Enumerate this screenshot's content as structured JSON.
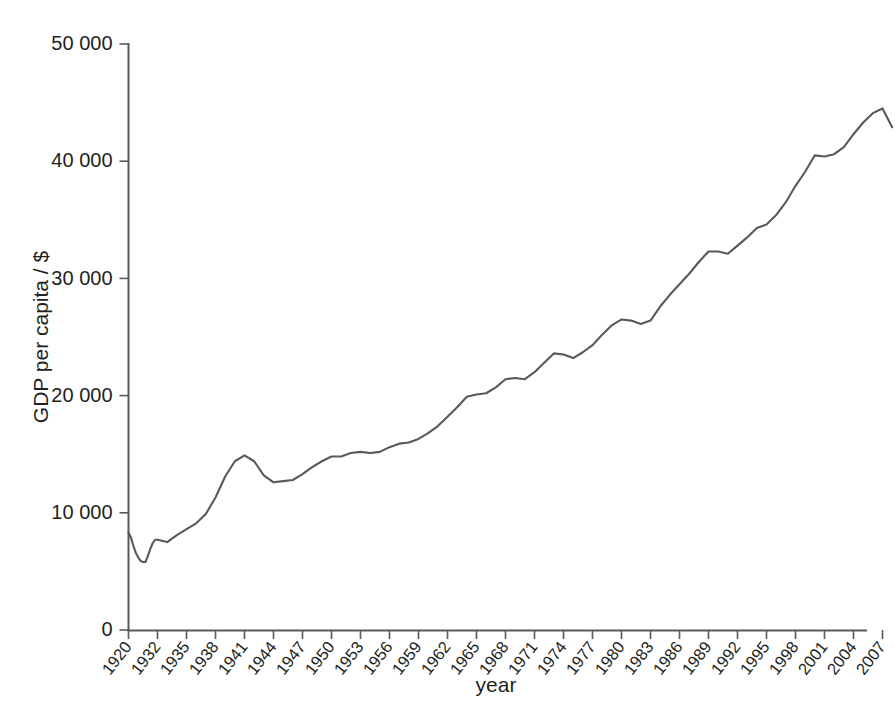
{
  "chart_data": {
    "type": "line",
    "title": "",
    "xlabel": "year",
    "ylabel": "GDP per capita / $",
    "xlim": [
      1920,
      2008
    ],
    "ylim": [
      0,
      50000
    ],
    "grid": false,
    "legend": "none",
    "line_color": "#58595b",
    "x_tick_labels": [
      "1920",
      "1932",
      "1935",
      "1938",
      "1941",
      "1944",
      "1947",
      "1950",
      "1953",
      "1956",
      "1959",
      "1962",
      "1965",
      "1968",
      "1971",
      "1974",
      "1977",
      "1980",
      "1983",
      "1986",
      "1989",
      "1992",
      "1995",
      "1998",
      "2001",
      "2004",
      "2007"
    ],
    "x_tick_values": [
      1920,
      1932,
      1935,
      1938,
      1941,
      1944,
      1947,
      1950,
      1953,
      1956,
      1959,
      1962,
      1965,
      1968,
      1971,
      1974,
      1977,
      1980,
      1983,
      1986,
      1989,
      1992,
      1995,
      1998,
      2001,
      2004,
      2007
    ],
    "y_tick_labels": [
      "0",
      "10 000",
      "20 000",
      "30 000",
      "40 000",
      "50 000"
    ],
    "y_tick_values": [
      0,
      10000,
      20000,
      30000,
      40000,
      50000
    ],
    "x": [
      1920,
      1921,
      1922,
      1923,
      1924,
      1925,
      1926,
      1927,
      1928,
      1929,
      1930,
      1931,
      1932,
      1933,
      1934,
      1935,
      1936,
      1937,
      1938,
      1939,
      1940,
      1941,
      1942,
      1943,
      1944,
      1945,
      1946,
      1947,
      1948,
      1949,
      1950,
      1951,
      1952,
      1953,
      1954,
      1955,
      1956,
      1957,
      1958,
      1959,
      1960,
      1961,
      1962,
      1963,
      1964,
      1965,
      1966,
      1967,
      1968,
      1969,
      1970,
      1971,
      1972,
      1973,
      1974,
      1975,
      1976,
      1977,
      1978,
      1979,
      1980,
      1981,
      1982,
      1983,
      1984,
      1985,
      1986,
      1987,
      1988,
      1989,
      1990,
      1991,
      1992,
      1993,
      1994,
      1995,
      1996,
      1997,
      1998,
      1999,
      2000,
      2001,
      2002,
      2003,
      2004,
      2005,
      2006,
      2007,
      2008
    ],
    "values": [
      8300,
      7900,
      7200,
      6600,
      6200,
      5900,
      5800,
      5800,
      6300,
      6900,
      7400,
      7700,
      7700,
      7500,
      8100,
      8600,
      9100,
      9900,
      11300,
      13100,
      14400,
      14900,
      14400,
      13200,
      12600,
      12700,
      12800,
      13300,
      13900,
      14400,
      14800,
      14800,
      15100,
      15200,
      15100,
      15200,
      15600,
      15900,
      16000,
      16300,
      16800,
      17400,
      18200,
      19000,
      19900,
      20100,
      20200,
      20700,
      21400,
      21500,
      21400,
      22000,
      22800,
      23600,
      23500,
      23200,
      23700,
      24300,
      25200,
      26000,
      26500,
      26400,
      26100,
      26400,
      27600,
      28600,
      29500,
      30400,
      31400,
      32300,
      32300,
      32100,
      32800,
      33500,
      34300,
      34600,
      35400,
      36500,
      37900,
      39100,
      40500,
      40400,
      40600,
      41200,
      42300,
      43300,
      44100,
      44500,
      42900
    ]
  },
  "axis_title_x": "year",
  "axis_title_y": "GDP per capita / $"
}
